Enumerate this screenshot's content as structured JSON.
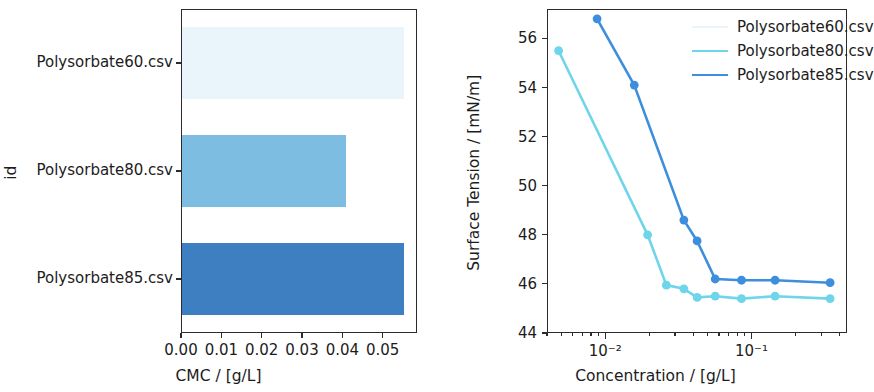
{
  "chart_data": [
    {
      "type": "bar",
      "orientation": "horizontal",
      "title": "",
      "xlabel": "CMC / [g/L]",
      "ylabel": "id",
      "categories": [
        "Polysorbate60.csv",
        "Polysorbate80.csv",
        "Polysorbate85.csv"
      ],
      "values": [
        0.0552,
        0.041,
        0.0552
      ],
      "colors": [
        "#eaf4fb",
        "#7dbde2",
        "#3d7fc0"
      ],
      "xlim": [
        0.0,
        0.0585
      ],
      "xticks": [
        0.0,
        0.01,
        0.02,
        0.03,
        0.04,
        0.05
      ],
      "xticklabels": [
        "0.00",
        "0.01",
        "0.02",
        "0.03",
        "0.04",
        "0.05"
      ],
      "grid": false,
      "legend": "none"
    },
    {
      "type": "line",
      "title": "",
      "xlabel": "Concentration / [g/L]",
      "ylabel": "Surface Tension / [mN/m]",
      "xscale": "log",
      "xlim": [
        0.004,
        0.45
      ],
      "ylim": [
        44,
        57.2
      ],
      "yticks": [
        44,
        46,
        48,
        50,
        52,
        54,
        56
      ],
      "yticklabels": [
        "44",
        "46",
        "48",
        "50",
        "52",
        "54",
        "56"
      ],
      "xtick_labels": [
        "10⁻²",
        "10⁻¹"
      ],
      "xtick_values": [
        0.01,
        0.1
      ],
      "grid": false,
      "legend_position": "upper right",
      "series": [
        {
          "name": "Polysorbate60.csv",
          "color": "#eaf4fb",
          "x": [],
          "y": []
        },
        {
          "name": "Polysorbate80.csv",
          "color": "#6ed5ea",
          "x": [
            0.0048,
            0.0195,
            0.0262,
            0.0345,
            0.0425,
            0.0565,
            0.0855,
            0.145,
            0.345
          ],
          "y": [
            55.5,
            48.0,
            45.95,
            45.8,
            45.45,
            45.5,
            45.4,
            45.5,
            45.4
          ]
        },
        {
          "name": "Polysorbate85.csv",
          "color": "#3d8edc",
          "x": [
            0.0088,
            0.0158,
            0.0345,
            0.0425,
            0.0565,
            0.0855,
            0.145,
            0.345
          ],
          "y": [
            56.8,
            54.1,
            48.6,
            47.75,
            46.2,
            46.15,
            46.15,
            46.05
          ]
        }
      ]
    }
  ],
  "bar_panel": {
    "xlabel": "CMC / [g/L]",
    "ylabel": "id",
    "ytick_labels": [
      "Polysorbate60.csv",
      "Polysorbate80.csv",
      "Polysorbate85.csv"
    ],
    "xtick_labels": [
      "0.00",
      "0.01",
      "0.02",
      "0.03",
      "0.04",
      "0.05"
    ]
  },
  "line_panel": {
    "xlabel": "Concentration / [g/L]",
    "ylabel": "Surface Tension / [mN/m]",
    "ytick_labels": [
      "44",
      "46",
      "48",
      "50",
      "52",
      "54",
      "56"
    ],
    "xtick_labels": [
      "10⁻²",
      "10⁻¹"
    ],
    "legend": [
      {
        "label": "Polysorbate60.csv",
        "color": "#eaf4fb"
      },
      {
        "label": "Polysorbate80.csv",
        "color": "#6ed5ea"
      },
      {
        "label": "Polysorbate85.csv",
        "color": "#3d8edc"
      }
    ]
  }
}
